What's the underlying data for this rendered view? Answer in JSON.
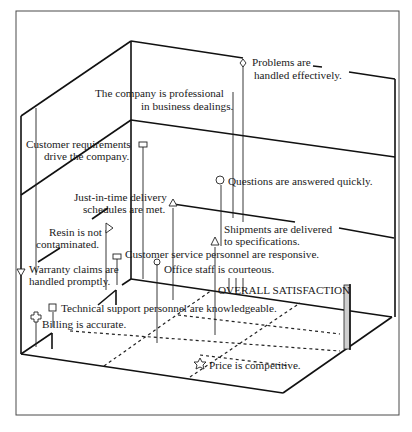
{
  "diagram": {
    "axis_label": "OVERALL SATISFACTION",
    "attributes": [
      {
        "label_line1": "Problems are",
        "label_line2": "handled effectively.",
        "symbol": "diamond"
      },
      {
        "label_line1": "The company is professional",
        "label_line2": "in business dealings.",
        "symbol": "none"
      },
      {
        "label_line1": "Customer requirements",
        "label_line2": "drive the company.",
        "symbol": "small-rectangle"
      },
      {
        "label_line1": "Questions are answered quickly.",
        "label_line2": "",
        "symbol": "circle"
      },
      {
        "label_line1": "Just-in-time delivery",
        "label_line2": "schedules are met.",
        "symbol": "triangle"
      },
      {
        "label_line1": "Shipments are delivered",
        "label_line2": "to specifications.",
        "symbol": "triangle"
      },
      {
        "label_line1": "Resin is not",
        "label_line2": "contaminated.",
        "symbol": "flag"
      },
      {
        "label_line1": "Customer service personnel are responsive.",
        "label_line2": "",
        "symbol": "small-rectangle"
      },
      {
        "label_line1": "Office staff is courteous.",
        "label_line2": "",
        "symbol": "club"
      },
      {
        "label_line1": "Warranty claims are",
        "label_line2": "handled promptly.",
        "symbol": "down-triangle"
      },
      {
        "label_line1": "Technical support personnel are knowledgeable.",
        "label_line2": "",
        "symbol": "square"
      },
      {
        "label_line1": "Billing is accurate.",
        "label_line2": "",
        "symbol": "cross"
      },
      {
        "label_line1": "Price is competitive.",
        "label_line2": "",
        "symbol": "star"
      }
    ]
  }
}
